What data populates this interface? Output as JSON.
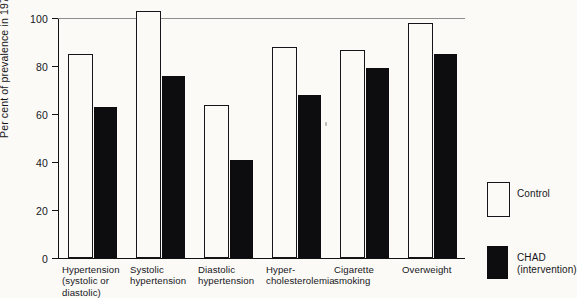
{
  "chart_data": {
    "type": "bar",
    "title": "",
    "xlabel": "",
    "ylabel": "Per cent of prevalence in 1970",
    "ylim": [
      0,
      100
    ],
    "yticks": [
      0,
      20,
      40,
      60,
      80,
      100
    ],
    "grid": "horizontal line at 100 only",
    "legend_position": "right",
    "categories": [
      "Hypertension\n(systolic or\ndiastolic)",
      "Systolic\nhypertension",
      "Diastolic\nhypertension",
      "Hyper-\ncholesterolemia",
      "Cigarette\nsmoking",
      "Overweight"
    ],
    "series": [
      {
        "name": "Control",
        "color": "#ffffff",
        "values": [
          84,
          102,
          63,
          87,
          86,
          97
        ]
      },
      {
        "name": "CHAD (intervention)",
        "color": "#000000",
        "values": [
          63,
          76,
          41,
          68,
          79,
          85
        ]
      }
    ]
  },
  "axis": {
    "y_label": "Per cent of prevalence in 1970",
    "y_ticks": [
      "0",
      "20",
      "40",
      "60",
      "80",
      "100"
    ]
  },
  "legend": {
    "items": [
      {
        "label": "Control",
        "swatch": "outline-white"
      },
      {
        "label": "CHAD\n(intervention)",
        "swatch": "solid-black"
      }
    ]
  },
  "colors": {
    "control_fill": "#fbfaf7",
    "control_stroke": "#15151a",
    "intervention_fill": "#0d0d0f",
    "gridline": "#8d8d8d",
    "axis": "#111111",
    "background": "#fbfaf7"
  }
}
